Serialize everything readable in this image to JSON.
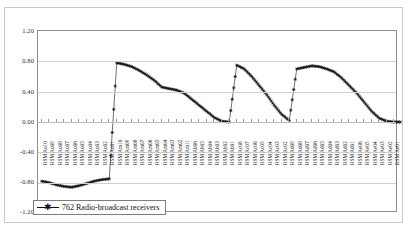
{
  "chart_data": {
    "type": "line",
    "title": "",
    "xlabel": "",
    "ylabel": "",
    "ylim": [
      -1.2,
      1.2
    ],
    "ytick_values": [
      1.2,
      0.8,
      0.4,
      0.0,
      -0.4,
      -0.8,
      -1.2
    ],
    "ytick_labels": [
      "1.20",
      "0.80",
      "0.40",
      "0.00",
      "-0.40",
      "-0.80",
      "-1.20"
    ],
    "grid": true,
    "grid_axis": "y",
    "legend_position": "bottom-left",
    "series": [
      {
        "name": "762  Radio-broadcast receivers",
        "marker": "star",
        "color": "#111111",
        "categories": [
          "RSM Ao10",
          "RSM Ao09",
          "RSM Ao08",
          "RSM Ao07",
          "RSM Ao06",
          "RSM Ao05",
          "RSM Ao04",
          "RSM Ao03",
          "RSM Ao02",
          "RSM Ao01",
          "RSM Am10",
          "RSM Am09",
          "RSM Am08",
          "RSM Am07",
          "RSM Am06",
          "RSM Am05",
          "RSM Am04",
          "RSM Am03",
          "RSM Am02",
          "RSM Am11",
          "RSM Ab06",
          "RSM Ab05",
          "RSM Ab04",
          "RSM Ab03",
          "RSM Ab02",
          "RSM Ab01",
          "RSM Ac08",
          "RSM Ac07",
          "RSM Ac06",
          "RSM Ac05",
          "RSM Ac04",
          "RSM Ac03",
          "RSM Ac02",
          "RSM Ad09",
          "RSM Ad08",
          "RSM Ad07",
          "RSM Ad06",
          "RSM Ad05",
          "RSM Ad04",
          "RSM Ad03",
          "RSM Ad02",
          "RSM Ad01",
          "RSM Ae06",
          "RSM Ae05",
          "RSM Ae04",
          "RSM Ae03",
          "RSM Ae02",
          "RSM Ae01"
        ],
        "values": [
          -0.78,
          -0.8,
          -0.83,
          -0.85,
          -0.86,
          -0.84,
          -0.81,
          -0.78,
          -0.76,
          -0.75,
          0.78,
          0.76,
          0.73,
          0.68,
          0.62,
          0.55,
          0.46,
          0.44,
          0.42,
          0.38,
          0.3,
          0.22,
          0.14,
          0.06,
          0.01,
          0.0,
          0.75,
          0.7,
          0.6,
          0.48,
          0.36,
          0.22,
          0.1,
          0.02,
          0.7,
          0.72,
          0.74,
          0.73,
          0.7,
          0.66,
          0.58,
          0.48,
          0.38,
          0.26,
          0.14,
          0.05,
          0.01,
          0.0
        ]
      }
    ],
    "legend_entries": [
      "762  Radio-broadcast receivers"
    ],
    "annotations": []
  },
  "yaxis": {
    "ticks": [
      {
        "label": "1.20",
        "top": 19
      },
      {
        "label": "0.80",
        "top": 49
      },
      {
        "label": "0.40",
        "top": 80
      },
      {
        "label": "0.00",
        "top": 110
      },
      {
        "label": "-0.40",
        "top": 140
      },
      {
        "label": "-0.80",
        "top": 170
      },
      {
        "label": "-1.20",
        "top": 200
      }
    ]
  },
  "xaxis": {
    "labels": [
      "RSM Ao10",
      "RSM Ao09",
      "RSM Ao08",
      "RSM Ao07",
      "RSM Ao06",
      "RSM Ao05",
      "RSM Ao04",
      "RSM Ao03",
      "RSM Ao02",
      "RSM Ao01",
      "RSM Am10",
      "RSM Am09",
      "RSM Am08",
      "RSM Am07",
      "RSM Am06",
      "RSM Am05",
      "RSM Am04",
      "RSM Am03",
      "RSM Am02",
      "RSM Am11",
      "RSM Ab06",
      "RSM Ab05",
      "RSM Ab04",
      "RSM Ab03",
      "RSM Ab02",
      "RSM Ab01",
      "RSM Ac08",
      "RSM Ac07",
      "RSM Ac06",
      "RSM Ac05",
      "RSM Ac04",
      "RSM Ac03",
      "RSM Ac02",
      "RSM Ad09",
      "RSM Ad08",
      "RSM Ad07",
      "RSM Ad06",
      "RSM Ad05",
      "RSM Ad04",
      "RSM Ad03",
      "RSM Ad02",
      "RSM Ad01",
      "RSM Ae06",
      "RSM Ae05",
      "RSM Ae04",
      "RSM Ae03",
      "RSM Ae02",
      "RSM Ae01"
    ]
  },
  "legend": {
    "marker": "star-marker",
    "label": "762  Radio-broadcast receivers"
  },
  "colors": {
    "series": "#111111",
    "grid": "#d0d0d0",
    "plot_border": "#8c8c8c",
    "frame_border": "#c9c9c9",
    "background": "#ffffff"
  }
}
